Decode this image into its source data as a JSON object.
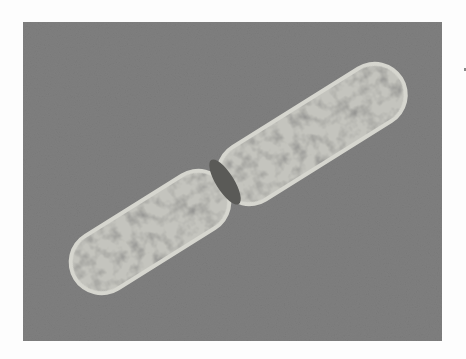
{
  "image": {
    "subject": "micrograph of a dividing rod-shaped bacterial cell",
    "description": "grayscale electron micrograph showing an elongated bacterium constricted in the middle (cell division), with a pale cell wall outline and mottled dark/light cytoplasm on a uniform gray background",
    "colors": {
      "page_background": "#fdfdfd",
      "photo_background": "#7f7f7f",
      "cell_wall": "#cfcfc8",
      "cytoplasm_light": "#c9c9c4",
      "cytoplasm_dark": "#4e4e4c"
    }
  }
}
